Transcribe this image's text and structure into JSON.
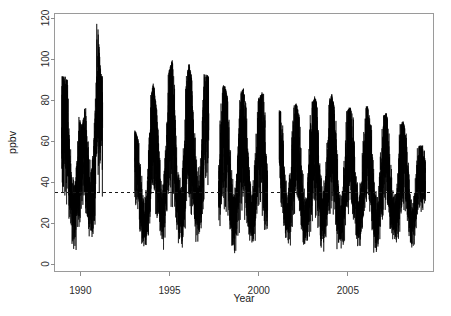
{
  "chart_data": {
    "type": "line",
    "title": "",
    "subtitle": "",
    "xlabel": "Year",
    "ylabel": "ppbv",
    "xlim": [
      1988.55,
      2009.8
    ],
    "ylim": [
      0,
      122
    ],
    "xticks": [
      1990,
      1995,
      2000,
      2005
    ],
    "xtick_labels": [
      "1990",
      "1995",
      "2000",
      "2005"
    ],
    "yticks": [
      0,
      20,
      40,
      60,
      80,
      100,
      120
    ],
    "ytick_labels": [
      "0",
      "20",
      "40",
      "60",
      "80",
      "100",
      "120"
    ],
    "grid": false,
    "legend": null,
    "annotations": [
      {
        "name": "reference-line",
        "type": "hline",
        "value": 35,
        "style": "dashed",
        "color": "#1a1a1a",
        "label": ""
      }
    ],
    "series": [
      {
        "name": "ppbv",
        "color": "#000000",
        "style": "solid",
        "description": "Daily/high-frequency surface measurement time series with strong annual seasonality; winter-spring peaks 60-120 ppbv, summer-autumn troughs 2-20 ppbv; long data gap 1991.2-1993.1, short gaps near 1997.4 and 2000.7",
        "summary": {
          "n_gaps": 3,
          "gaps": [
            [
              1991.25,
              1993.05
            ],
            [
              1997.2,
              1997.75
            ],
            [
              2000.5,
              2001.15
            ]
          ],
          "global_max": 120,
          "global_max_year": 1990.95,
          "global_min": 1.5,
          "mean_level": 35,
          "data_start": 1988.95,
          "data_end": 2009.35
        },
        "seasonal_cycles": [
          {
            "year": 1989.1,
            "peak": 92,
            "trough": 12
          },
          {
            "year": 1989.4,
            "peak": 89,
            "trough": 8
          },
          {
            "year": 1990.1,
            "peak": 67,
            "trough": 4
          },
          {
            "year": 1990.95,
            "peak": 120,
            "trough": 10
          },
          {
            "year": 1991.15,
            "peak": 93,
            "trough": 16
          },
          {
            "year": 1993.2,
            "peak": 63,
            "trough": 14
          },
          {
            "year": 1993.35,
            "peak": 58,
            "trough": 6
          },
          {
            "year": 1994.1,
            "peak": 89,
            "trough": 5
          },
          {
            "year": 1994.3,
            "peak": 74,
            "trough": 9
          },
          {
            "year": 1995.15,
            "peak": 100,
            "trough": 3
          },
          {
            "year": 1995.4,
            "peak": 76,
            "trough": 8
          },
          {
            "year": 1996.1,
            "peak": 98,
            "trough": 5
          },
          {
            "year": 1996.3,
            "peak": 88,
            "trough": 4
          },
          {
            "year": 1996.95,
            "peak": 93,
            "trough": 16
          },
          {
            "year": 1998.1,
            "peak": 87,
            "trough": 6
          },
          {
            "year": 1998.35,
            "peak": 78,
            "trough": 3
          },
          {
            "year": 1999.15,
            "peak": 86,
            "trough": 4
          },
          {
            "year": 1999.4,
            "peak": 72,
            "trough": 7
          },
          {
            "year": 2000.2,
            "peak": 84,
            "trough": 5
          },
          {
            "year": 2001.3,
            "peak": 74,
            "trough": 10
          },
          {
            "year": 2002.1,
            "peak": 79,
            "trough": 3
          },
          {
            "year": 2002.35,
            "peak": 70,
            "trough": 6
          },
          {
            "year": 2003.15,
            "peak": 82,
            "trough": 4
          },
          {
            "year": 2003.4,
            "peak": 73,
            "trough": 5
          },
          {
            "year": 2004.1,
            "peak": 83,
            "trough": 7
          },
          {
            "year": 2004.35,
            "peak": 72,
            "trough": 4
          },
          {
            "year": 2005.15,
            "peak": 77,
            "trough": 5
          },
          {
            "year": 2005.4,
            "peak": 68,
            "trough": 8
          },
          {
            "year": 2006.1,
            "peak": 78,
            "trough": 6
          },
          {
            "year": 2006.35,
            "peak": 66,
            "trough": 4
          },
          {
            "year": 2007.15,
            "peak": 74,
            "trough": 5
          },
          {
            "year": 2007.4,
            "peak": 63,
            "trough": 9
          },
          {
            "year": 2008.1,
            "peak": 70,
            "trough": 4
          },
          {
            "year": 2008.4,
            "peak": 61,
            "trough": 6
          },
          {
            "year": 2009.1,
            "peak": 58,
            "trough": 12
          }
        ]
      }
    ]
  },
  "figure": {
    "background_color": "#ffffff",
    "series_color": "#000000",
    "axis_color": "#8c8c8c"
  }
}
